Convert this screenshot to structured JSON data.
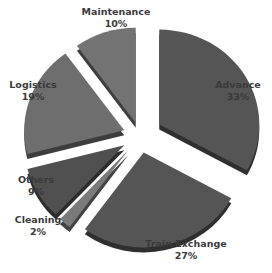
{
  "chart_data": {
    "type": "pie",
    "title": "",
    "style": "3d-exploded-grayscale",
    "categories": [
      "Advance",
      "Train Exchange",
      "Cleaning",
      "Others",
      "Logistics",
      "Maintenance"
    ],
    "values": [
      33,
      27,
      2,
      9,
      19,
      10
    ],
    "unit": "%",
    "labels": [
      {
        "name": "Advance",
        "pct": "33%"
      },
      {
        "name": "Train Exchange",
        "pct": "27%"
      },
      {
        "name": "Cleaning",
        "pct": "2%"
      },
      {
        "name": "Others",
        "pct": "9%"
      },
      {
        "name": "Logistics",
        "pct": "19%"
      },
      {
        "name": "Maintenance",
        "pct": "10%"
      }
    ],
    "colors": {
      "Advance": "#555555",
      "Train Exchange": "#555555",
      "Cleaning": "#7a7a7a",
      "Others": "#505050",
      "Logistics": "#6e6e6e",
      "Maintenance": "#737373"
    },
    "legend": "none (data labels on slices)"
  }
}
